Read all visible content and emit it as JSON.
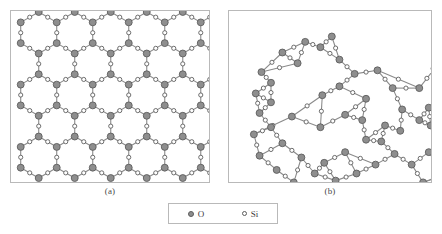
{
  "figure": {
    "panels": [
      {
        "id": "a",
        "caption": "(a)",
        "structure": "crystalline-silica-hexagonal-lattice"
      },
      {
        "id": "b",
        "caption": "(b)",
        "structure": "amorphous-silica-random-network"
      }
    ]
  },
  "legend": {
    "entries": [
      {
        "symbol": "O",
        "marker": "filled-circle"
      },
      {
        "symbol": "Si",
        "marker": "open-circle"
      }
    ]
  },
  "colors": {
    "oxygen_fill": "#8e8e8e",
    "oxygen_stroke": "#5d5d5d",
    "silicon_fill": "#ffffff",
    "silicon_stroke": "#5d5d5d",
    "bond": "#8a8a8a",
    "panel_border": "#b9b9b9",
    "text": "#3a3a3a"
  },
  "chart_data": {
    "type": "scatter",
    "title": "",
    "xlabel": "",
    "ylabel": "",
    "panel_a": {
      "label": "(a)",
      "description": "Two-dimensional ordered crystalline silica network of regular hexagonal rings",
      "hex_columns": 5,
      "hex_rows": 4,
      "hex_radius": 21,
      "origin_x": 28,
      "origin_y": 22,
      "oxygen_count": 120,
      "silicon_count": 60
    },
    "panel_b": {
      "label": "(b)",
      "description": "Two-dimensional disordered amorphous silica (glass) random network with rings of varied size",
      "oxygen": [
        [
          92,
          34
        ],
        [
          68,
          52
        ],
        [
          40,
          74
        ],
        [
          40,
          96
        ],
        [
          62,
          112
        ],
        [
          92,
          124
        ],
        [
          118,
          110
        ],
        [
          140,
          92
        ],
        [
          128,
          64
        ],
        [
          112,
          48
        ],
        [
          152,
          60
        ],
        [
          168,
          80
        ],
        [
          178,
          104
        ],
        [
          160,
          122
        ],
        [
          140,
          138
        ],
        [
          118,
          152
        ],
        [
          96,
          164
        ],
        [
          72,
          158
        ],
        [
          52,
          142
        ],
        [
          40,
          124
        ],
        [
          232,
          36
        ],
        [
          212,
          58
        ],
        [
          196,
          80
        ],
        [
          206,
          102
        ],
        [
          230,
          112
        ],
        [
          252,
          96
        ],
        [
          262,
          74
        ],
        [
          250,
          52
        ],
        [
          276,
          62
        ],
        [
          296,
          78
        ],
        [
          318,
          66
        ],
        [
          340,
          58
        ],
        [
          362,
          70
        ],
        [
          380,
          86
        ],
        [
          372,
          108
        ],
        [
          352,
          120
        ],
        [
          330,
          112
        ],
        [
          310,
          96
        ],
        [
          292,
          108
        ],
        [
          276,
          126
        ],
        [
          258,
          140
        ],
        [
          242,
          124
        ],
        [
          224,
          138
        ],
        [
          206,
          152
        ],
        [
          188,
          166
        ],
        [
          170,
          154
        ],
        [
          150,
          166
        ],
        [
          130,
          176
        ],
        [
          108,
          184
        ],
        [
          86,
          176
        ],
        [
          64,
          186
        ],
        [
          46,
          172
        ],
        [
          28,
          156
        ],
        [
          22,
          132
        ],
        [
          28,
          108
        ],
        [
          24,
          86
        ],
        [
          30,
          62
        ],
        [
          52,
          40
        ],
        [
          76,
          28
        ],
        [
          104,
          22
        ],
        [
          386,
          128
        ],
        [
          372,
          146
        ],
        [
          350,
          156
        ],
        [
          328,
          146
        ],
        [
          306,
          156
        ],
        [
          286,
          168
        ],
        [
          264,
          176
        ],
        [
          244,
          168
        ],
        [
          222,
          178
        ],
        [
          200,
          186
        ],
        [
          398,
          100
        ],
        [
          404,
          76
        ],
        [
          392,
          54
        ],
        [
          370,
          40
        ],
        [
          348,
          44
        ],
        [
          326,
          34
        ],
        [
          304,
          46
        ],
        [
          286,
          34
        ],
        [
          268,
          28
        ],
        [
          248,
          22
        ],
        [
          94,
          88
        ],
        [
          112,
          78
        ],
        [
          136,
          116
        ],
        [
          156,
          140
        ],
        [
          176,
          128
        ],
        [
          196,
          116
        ],
        [
          216,
          100
        ],
        [
          236,
          82
        ],
        [
          256,
          118
        ],
        [
          208,
          122
        ]
      ],
      "silicon": [
        [
          92,
          44
        ],
        [
          56,
          62
        ],
        [
          40,
          86
        ],
        [
          52,
          104
        ],
        [
          78,
          118
        ],
        [
          106,
          118
        ],
        [
          130,
          100
        ],
        [
          134,
          78
        ],
        [
          120,
          56
        ],
        [
          102,
          38
        ],
        [
          162,
          70
        ],
        [
          174,
          92
        ],
        [
          168,
          114
        ],
        [
          150,
          130
        ],
        [
          128,
          146
        ],
        [
          106,
          158
        ],
        [
          82,
          162
        ],
        [
          60,
          150
        ],
        [
          44,
          134
        ],
        [
          34,
          114
        ],
        [
          222,
          46
        ],
        [
          204,
          68
        ],
        [
          200,
          92
        ],
        [
          218,
          108
        ],
        [
          242,
          104
        ],
        [
          258,
          84
        ],
        [
          256,
          62
        ],
        [
          262,
          58
        ],
        [
          286,
          70
        ],
        [
          308,
          72
        ],
        [
          330,
          62
        ],
        [
          352,
          64
        ],
        [
          372,
          78
        ],
        [
          376,
          98
        ],
        [
          362,
          114
        ],
        [
          340,
          116
        ],
        [
          318,
          104
        ],
        [
          300,
          102
        ],
        [
          284,
          118
        ],
        [
          266,
          134
        ],
        [
          250,
          132
        ],
        [
          232,
          132
        ],
        [
          214,
          146
        ],
        [
          196,
          160
        ],
        [
          178,
          160
        ],
        [
          160,
          160
        ],
        [
          138,
          172
        ],
        [
          118,
          180
        ],
        [
          96,
          180
        ],
        [
          74,
          182
        ],
        [
          54,
          180
        ],
        [
          36,
          164
        ],
        [
          24,
          144
        ],
        [
          24,
          120
        ],
        [
          26,
          96
        ],
        [
          26,
          74
        ],
        [
          40,
          50
        ],
        [
          64,
          32
        ],
        [
          90,
          24
        ],
        [
          118,
          30
        ],
        [
          380,
          138
        ],
        [
          360,
          152
        ],
        [
          338,
          152
        ],
        [
          316,
          152
        ],
        [
          296,
          162
        ],
        [
          274,
          172
        ],
        [
          254,
          172
        ],
        [
          232,
          174
        ],
        [
          210,
          182
        ],
        [
          186,
          188
        ],
        [
          402,
          88
        ],
        [
          398,
          64
        ],
        [
          380,
          46
        ],
        [
          358,
          40
        ],
        [
          338,
          38
        ],
        [
          314,
          38
        ],
        [
          294,
          38
        ],
        [
          276,
          30
        ],
        [
          258,
          24
        ],
        [
          240,
          22
        ]
      ],
      "bonds_note": "Each Si bridges two neighbouring O atoms; network contains 5-, 6-, 7- and 8-membered rings plus one dense over-coordinated cluster at lower left"
    }
  }
}
